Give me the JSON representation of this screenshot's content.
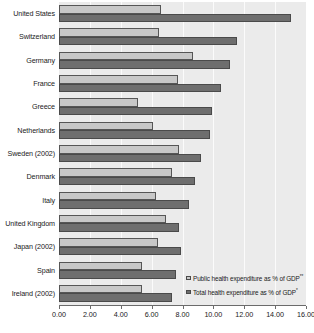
{
  "chart_data": {
    "type": "bar",
    "orientation": "horizontal",
    "title": "",
    "xlabel": "",
    "ylabel": "",
    "xlim": [
      0,
      16
    ],
    "xticks": [
      "0.00",
      "2.00",
      "4.00",
      "6.00",
      "8.00",
      "10.00",
      "12.00",
      "14.00",
      "16.00"
    ],
    "xtick_values": [
      0,
      2,
      4,
      6,
      8,
      10,
      12,
      14,
      16
    ],
    "grid": true,
    "grid_axis": "x",
    "legend_position": "bottom-right",
    "categories": [
      "United States",
      "Switzerland",
      "Germany",
      "France",
      "Greece",
      "Netherlands",
      "Sweden (2002)",
      "Denmark",
      "Italy",
      "United Kingdom",
      "Japan (2002)",
      "Spain",
      "Ireland (2002)"
    ],
    "series": [
      {
        "name": "Public health expenditure as % of GDP",
        "name_superscript": "**",
        "color": "#c8c8c8",
        "values": [
          6.6,
          6.5,
          8.7,
          7.7,
          5.1,
          6.1,
          7.8,
          7.3,
          6.3,
          6.9,
          6.4,
          5.4,
          5.4
        ]
      },
      {
        "name": "Total health expenditure as % of GDP",
        "name_superscript": "*",
        "color": "#6e6e6e",
        "values": [
          15.0,
          11.5,
          11.1,
          10.5,
          9.9,
          9.8,
          9.2,
          8.8,
          8.4,
          7.8,
          7.9,
          7.6,
          7.3
        ]
      }
    ]
  },
  "legend": {
    "items": [
      {
        "label": "Public health expenditure as % of GDP",
        "superscript": "**",
        "swatch": "public"
      },
      {
        "label": "Total health expenditure as % of GDP",
        "superscript": "*",
        "swatch": "total"
      }
    ]
  },
  "colors": {
    "public_bar": "#c8c8c8",
    "total_bar": "#6e6e6e",
    "plot_background": "#ebebeb",
    "gridline": "#fbfbfb",
    "axis": "#6b6b6b",
    "text": "#1a1a1a"
  }
}
